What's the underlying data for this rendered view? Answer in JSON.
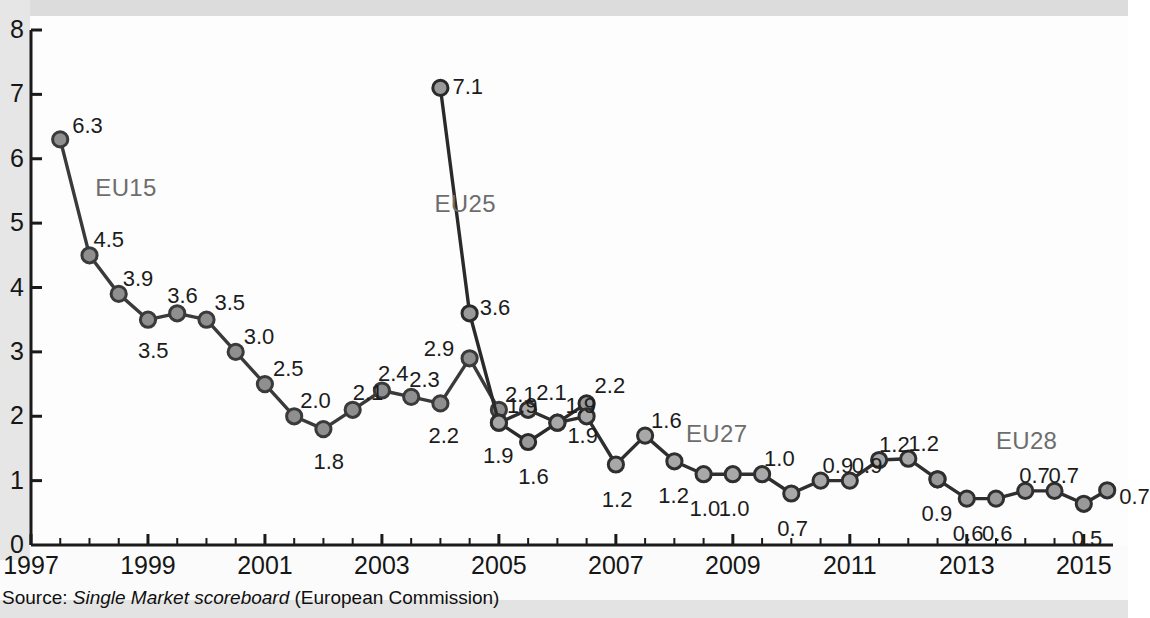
{
  "chart_data": {
    "type": "line",
    "title": "",
    "xlabel": "",
    "ylabel": "",
    "ylim": [
      0,
      8
    ],
    "xlim": [
      1997,
      2015.5
    ],
    "yticks": [
      "0",
      "1",
      "2",
      "3",
      "4",
      "5",
      "6",
      "7",
      "8"
    ],
    "xticks": [
      "1997",
      "1999",
      "2001",
      "2003",
      "2005",
      "2007",
      "2009",
      "2011",
      "2013",
      "2015"
    ],
    "grid": false,
    "legend_position": "inline-annotations",
    "series": [
      {
        "name": "EU15",
        "label_x": 1998.1,
        "label_y": 5.55,
        "marker_fill": "#8f8f8f",
        "line_color": "#3a3a3a",
        "points": [
          {
            "x": 1997.5,
            "y": 6.3,
            "label": "6.3",
            "lx": 14,
            "ly": -30
          },
          {
            "x": 1998.0,
            "y": 4.5,
            "label": "4.5",
            "lx": 6,
            "ly": -32
          },
          {
            "x": 1998.5,
            "y": 3.9,
            "label": "3.9",
            "lx": 6,
            "ly": -32
          },
          {
            "x": 1999.0,
            "y": 3.5,
            "label": "3.5",
            "lx": -8,
            "ly": 14
          },
          {
            "x": 1999.5,
            "y": 3.6,
            "label": "3.6",
            "lx": -8,
            "ly": -34
          },
          {
            "x": 2000.0,
            "y": 3.5,
            "label": "3.5",
            "lx": 10,
            "ly": -34
          },
          {
            "x": 2000.5,
            "y": 3.0,
            "label": "3.0",
            "lx": 10,
            "ly": -32
          },
          {
            "x": 2001.0,
            "y": 2.5,
            "label": "2.5",
            "lx": 10,
            "ly": -32
          },
          {
            "x": 2001.5,
            "y": 2.0,
            "label": "2.0",
            "lx": 8,
            "ly": -32
          },
          {
            "x": 2002.0,
            "y": 1.8,
            "label": "1.8",
            "lx": -8,
            "ly": 16
          },
          {
            "x": 2002.5,
            "y": 2.1,
            "label": "2.1",
            "lx": 2,
            "ly": -34
          },
          {
            "x": 2003.0,
            "y": 2.4,
            "label": "2.4",
            "lx": -2,
            "ly": -34
          },
          {
            "x": 2003.5,
            "y": 2.3,
            "label": "2.3",
            "lx": 0,
            "ly": -34
          },
          {
            "x": 2004.0,
            "y": 2.2,
            "label": "2.2",
            "lx": -10,
            "ly": 16
          },
          {
            "x": 2004.5,
            "y": 2.9,
            "label": "2.9",
            "lx": -44,
            "ly": -26
          },
          {
            "x": 2005.0,
            "y": 2.1,
            "label": "2.1",
            "lx": 8,
            "ly": -32
          }
        ]
      },
      {
        "name": "EU25",
        "label_x": 2003.9,
        "label_y": 5.3,
        "marker_fill": "#9a9a9a",
        "line_color": "#2a2a2a",
        "points": [
          {
            "x": 2004.0,
            "y": 7.1,
            "label": "7.1",
            "lx": 14,
            "ly": -18
          },
          {
            "x": 2004.5,
            "y": 3.6,
            "label": "3.6",
            "lx": 12,
            "ly": -22
          },
          {
            "x": 2005.0,
            "y": 1.9,
            "label": "1.9",
            "lx": -14,
            "ly": 16
          },
          {
            "x": 2005.5,
            "y": 1.6,
            "label": "1.6",
            "lx": -8,
            "ly": 18
          },
          {
            "x": 2006.0,
            "y": 1.9,
            "label": "1.9",
            "lx": 12,
            "ly": -4
          },
          {
            "x": 2006.5,
            "y": 2.2,
            "label": "2.2",
            "lx": 10,
            "ly": -34
          }
        ]
      },
      {
        "name": "EU27",
        "label_x": 2008.2,
        "label_y": 1.72,
        "marker_fill": "#a8a8a8",
        "line_color": "#2f2f2f",
        "points": [
          {
            "x": 2005.0,
            "y": 1.9,
            "label": "1.9",
            "lx": 10,
            "ly": -34
          },
          {
            "x": 2005.5,
            "y": 2.1,
            "label": "2.1",
            "lx": 10,
            "ly": -34
          },
          {
            "x": 2006.0,
            "y": 1.9,
            "label": "1.9",
            "lx": 10,
            "ly": -34
          },
          {
            "x": 2006.5,
            "y": 2.0,
            "label": "",
            "lx": 0,
            "ly": 0
          },
          {
            "x": 2007.0,
            "y": 1.25,
            "label": "1.2",
            "lx": -12,
            "ly": 18
          },
          {
            "x": 2007.5,
            "y": 1.7,
            "label": "1.6",
            "lx": 8,
            "ly": -32
          },
          {
            "x": 2008.0,
            "y": 1.3,
            "label": "1.2",
            "lx": -14,
            "ly": 18
          },
          {
            "x": 2008.5,
            "y": 1.1,
            "label": "1.0",
            "lx": -12,
            "ly": 18
          },
          {
            "x": 2009.0,
            "y": 1.1,
            "label": "1.0",
            "lx": -12,
            "ly": 18
          },
          {
            "x": 2009.5,
            "y": 1.1,
            "label": "1.0",
            "lx": 4,
            "ly": -32
          },
          {
            "x": 2010.0,
            "y": 0.8,
            "label": "0.7",
            "lx": -12,
            "ly": 18
          },
          {
            "x": 2010.5,
            "y": 1.0,
            "label": "0.9",
            "lx": 4,
            "ly": -32
          },
          {
            "x": 2011.0,
            "y": 1.0,
            "label": "0.9",
            "lx": 4,
            "ly": -32
          },
          {
            "x": 2011.5,
            "y": 1.32,
            "label": "1.2",
            "lx": 2,
            "ly": -32
          },
          {
            "x": 2012.0,
            "y": 1.34,
            "label": "1.2",
            "lx": 2,
            "ly": -32
          },
          {
            "x": 2012.5,
            "y": 1.02,
            "label": "0.9",
            "lx": -14,
            "ly": 18
          }
        ]
      },
      {
        "name": "EU28",
        "label_x": 2013.5,
        "label_y": 1.62,
        "marker_fill": "#999999",
        "line_color": "#2f2f2f",
        "points": [
          {
            "x": 2012.5,
            "y": 1.02,
            "label": "",
            "lx": 0,
            "ly": 0
          },
          {
            "x": 2013.0,
            "y": 0.72,
            "label": "0.6",
            "lx": -12,
            "ly": 18
          },
          {
            "x": 2013.5,
            "y": 0.72,
            "label": "0.6",
            "lx": -12,
            "ly": 18
          },
          {
            "x": 2014.0,
            "y": 0.84,
            "label": "0.7",
            "lx": -4,
            "ly": -32
          },
          {
            "x": 2014.5,
            "y": 0.84,
            "label": "0.7",
            "lx": -4,
            "ly": -32
          },
          {
            "x": 2015.0,
            "y": 0.64,
            "label": "0.5",
            "lx": -10,
            "ly": 18
          },
          {
            "x": 2015.4,
            "y": 0.85,
            "label": "0.7",
            "lx": 14,
            "ly": -10
          }
        ]
      }
    ]
  },
  "source": {
    "prefix": "Source: ",
    "italic": "Single Market scoreboard",
    "suffix": " (European Commission)"
  }
}
